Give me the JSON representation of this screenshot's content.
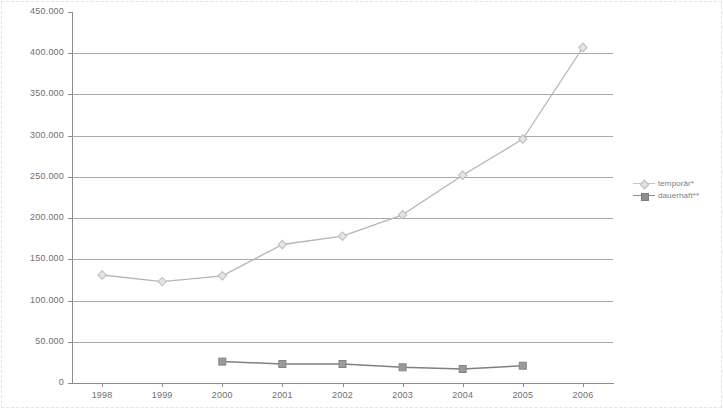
{
  "chart_data": {
    "type": "line",
    "title": "",
    "xlabel": "",
    "ylabel": "",
    "categories": [
      "1998",
      "1999",
      "2000",
      "2001",
      "2002",
      "2003",
      "2004",
      "2005",
      "2006"
    ],
    "ylim": [
      0,
      450000
    ],
    "ytick_values": [
      0,
      50000,
      100000,
      150000,
      200000,
      250000,
      300000,
      350000,
      400000,
      450000
    ],
    "ytick_labels": [
      "0",
      "50.000",
      "100.000",
      "150.000",
      "200.000",
      "250.000",
      "300.000",
      "350.000",
      "400.000",
      "450.000"
    ],
    "grid": true,
    "legend_position": "right",
    "series": [
      {
        "name": "temporär*",
        "color": "#b5b5b5",
        "marker": "diamond",
        "values": [
          131000,
          123000,
          130000,
          168000,
          178000,
          204000,
          252000,
          296000,
          407000
        ]
      },
      {
        "name": "dauerhaft**",
        "color": "#808080",
        "marker": "square",
        "values": [
          null,
          null,
          26000,
          23000,
          23000,
          19000,
          17000,
          21000,
          null
        ]
      }
    ]
  },
  "legend": {
    "items": [
      {
        "label": "temporär*",
        "marker": "diamond",
        "color": "#d9d9d9"
      },
      {
        "label": "dauerhaft**",
        "marker": "square",
        "color": "#8e8e8e"
      }
    ]
  },
  "colors": {
    "grid": "#9a9a9a",
    "axis": "#8c8c8c",
    "tick_text": "#6f6f6f",
    "series_temporaer": "#b5b5b5",
    "series_dauerhaft": "#808080",
    "background": "#ffffff"
  }
}
